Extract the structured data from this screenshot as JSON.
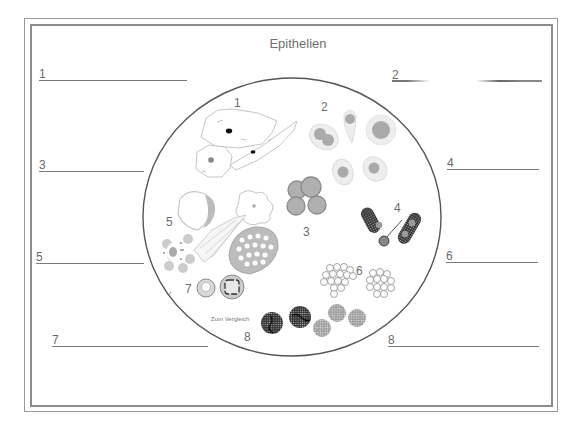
{
  "worksheet": {
    "title": "Epithelien",
    "comparison_note": "Zum Vergleich"
  },
  "answer_lines": [
    {
      "number": "1",
      "side": "left",
      "value": ""
    },
    {
      "number": "2",
      "side": "right",
      "value": ""
    },
    {
      "number": "3",
      "side": "left",
      "value": ""
    },
    {
      "number": "4",
      "side": "right",
      "value": ""
    },
    {
      "number": "5",
      "side": "left",
      "value": ""
    },
    {
      "number": "6",
      "side": "right",
      "value": ""
    },
    {
      "number": "7",
      "side": "left",
      "value": ""
    },
    {
      "number": "8",
      "side": "right",
      "value": ""
    }
  ],
  "diagram": {
    "labels": [
      "1",
      "2",
      "3",
      "4",
      "5",
      "6",
      "7",
      "8"
    ],
    "groups": [
      {
        "label": "1",
        "icon": "squamous-cells-illustration"
      },
      {
        "label": "2",
        "icon": "round-nucleated-cells-illustration"
      },
      {
        "label": "3",
        "icon": "grey-cell-cluster-illustration"
      },
      {
        "label": "4",
        "icon": "dark-elongated-cells-illustration"
      },
      {
        "label": "5",
        "icon": "mixed-cells-illustration"
      },
      {
        "label": "6",
        "icon": "grape-cluster-cells-illustration"
      },
      {
        "label": "7",
        "icon": "ringed-cells-illustration"
      },
      {
        "label": "8",
        "icon": "dotted-round-cells-illustration"
      }
    ]
  },
  "colors": {
    "frame": "#8c8c8c",
    "text": "#6a6a6a",
    "cell_fill": "#b8b8b8",
    "cell_dark": "#3a3a3a"
  }
}
